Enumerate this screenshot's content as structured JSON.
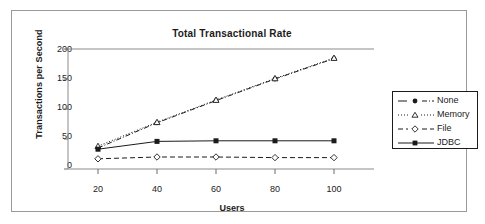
{
  "chart_data": {
    "type": "line",
    "title": "Total Transactional Rate",
    "xlabel": "Users",
    "ylabel": "Transactions per Second",
    "x": [
      20,
      40,
      60,
      80,
      100
    ],
    "categories": [
      "20",
      "40",
      "60",
      "80",
      "100"
    ],
    "xticks": [
      "20",
      "40",
      "60",
      "80",
      "100"
    ],
    "yticks": [
      "0",
      "50",
      "100",
      "150",
      "200"
    ],
    "xlim": [
      0,
      110
    ],
    "ylim": [
      0,
      200
    ],
    "grid": false,
    "legend_position": "right",
    "series": [
      {
        "name": "None",
        "values": [
          35,
          77,
          114,
          150,
          184
        ],
        "marker": "filled-circle",
        "dash": "dash-dot",
        "color": "#1b1b1b"
      },
      {
        "name": "Memory",
        "values": [
          38,
          78,
          115,
          151,
          185
        ],
        "marker": "open-triangle",
        "dash": "dotted",
        "color": "#1b1b1b"
      },
      {
        "name": "File",
        "values": [
          17,
          20,
          20,
          19,
          19
        ],
        "marker": "open-diamond",
        "dash": "dashed",
        "color": "#1b1b1b"
      },
      {
        "name": "JDBC",
        "values": [
          33,
          46,
          47,
          47,
          47
        ],
        "marker": "filled-square",
        "dash": "solid",
        "color": "#1b1b1b"
      }
    ]
  },
  "legend": {
    "items": [
      {
        "label": "None"
      },
      {
        "label": "Memory"
      },
      {
        "label": "File"
      },
      {
        "label": "JDBC"
      }
    ]
  },
  "colors": {
    "ink": "#1b1b1b",
    "axis": "#7a7a7a",
    "frame": "#9a9a9a",
    "background": "#ffffff"
  }
}
